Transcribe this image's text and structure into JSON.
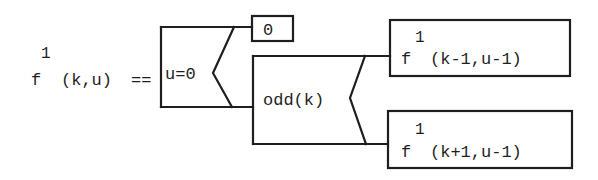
{
  "diagram": {
    "type": "nested conditional (Nassi-Shneiderman style) function definition",
    "definition": {
      "function_name": "f",
      "superscript": "1",
      "arguments": "(k,u)",
      "operator": "=="
    },
    "outer_condition": {
      "label": "u=0",
      "true_branch": {
        "label": "0"
      },
      "false_branch": {
        "inner_condition": {
          "label": "odd(k)",
          "true_branch": {
            "function_name": "f",
            "superscript": "1",
            "arguments": "(k-1,u-1)"
          },
          "false_branch": {
            "function_name": "f",
            "superscript": "1",
            "arguments": "(k+1,u-1)"
          }
        }
      }
    },
    "colors": {
      "ink": "#1e1e1e",
      "background": "#ffffff"
    }
  }
}
